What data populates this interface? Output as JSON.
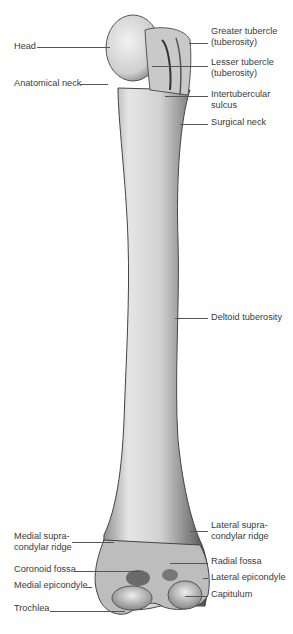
{
  "figure": {
    "labels": {
      "head": "Head",
      "anatomical_neck": "Anatomical neck",
      "greater_tubercle": "Greater tubercle\n(tuberosity)",
      "lesser_tubercle": "Lesser tubercle\n(tuberosity)",
      "intertubercular_sulcus": "Intertubercular\nsulcus",
      "surgical_neck": "Surgical neck",
      "deltoid_tuberosity": "Deltoid tuberosity",
      "medial_supracondylar_ridge": "Medial supra-\ncondylar ridge",
      "lateral_supracondylar_ridge": "Lateral supra-\ncondylar ridge",
      "coronoid_fossa": "Coronoid fossa",
      "radial_fossa": "Radial fossa",
      "medial_epicondyle": "Medial epicondyle",
      "lateral_epicondyle": "Lateral epicondyle",
      "capitulum": "Capitulum",
      "trochlea": "Trochlea"
    }
  }
}
